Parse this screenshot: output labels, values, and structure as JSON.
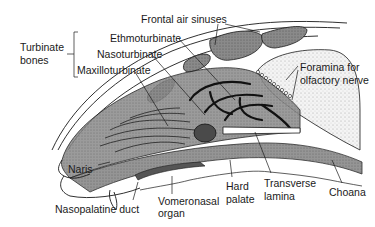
{
  "diagram": {
    "labels": {
      "turbinate_bones_line1": "Turbinate",
      "turbinate_bones_line2": "bones",
      "ethmoturbinate": "Ethmoturbinate",
      "nasoturbinate": "Nasoturbinate",
      "maxilloturbinate": "Maxilloturbinate",
      "frontal_air_sinuses": "Frontal air sinuses",
      "foramina_line1": "Foramina for",
      "foramina_line2": "olfactory nerve",
      "naris": "Naris",
      "nasopalatine_duct": "Nasopalatine duct",
      "vomeronasal_line1": "Vomeronasal",
      "vomeronasal_line2": "organ",
      "hard_palate_line1": "Hard",
      "hard_palate_line2": "palate",
      "transverse_lamina_line1": "Transverse",
      "transverse_lamina_line2": "lamina",
      "choana": "Choana"
    },
    "colors": {
      "line": "#1a1a1a",
      "tissue_dark": "#6e6e6e",
      "tissue_mid": "#9a9a9a",
      "tissue_light": "#c8c8c8",
      "stipple": "#dcdcdc",
      "background": "#ffffff"
    }
  }
}
